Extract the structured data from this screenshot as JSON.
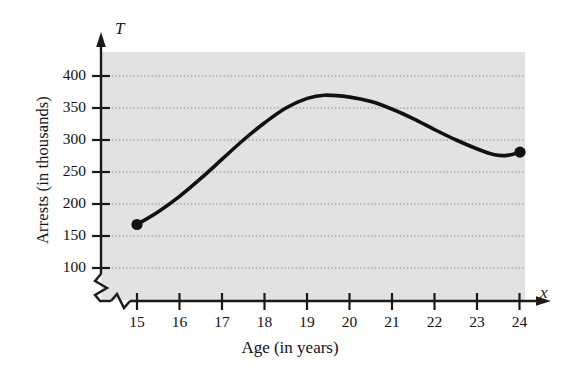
{
  "figure": {
    "background_color": "#ffffff",
    "plot_area_color": "#e2e2e2",
    "curve_color": "#111111",
    "gridline_color": "#8a8a8a",
    "axis_color": "#1a1a1a"
  },
  "axes": {
    "y_axis_name": "T",
    "x_axis_name": "x",
    "y_axis_label": "Arrests (in thousands)",
    "x_axis_label": "Age (in years)",
    "y_ticks": [
      "100",
      "150",
      "200",
      "250",
      "300",
      "350",
      "400"
    ],
    "x_ticks": [
      "15",
      "16",
      "17",
      "18",
      "19",
      "20",
      "21",
      "22",
      "23",
      "24"
    ],
    "y_axis_break": "zigzag",
    "x_axis_break": "zigzag"
  },
  "chart_data": {
    "type": "line",
    "title": "",
    "subtitle": "",
    "xlabel": "Age (in years)",
    "ylabel": "Arrests (in thousands)",
    "xlim": [
      15,
      24
    ],
    "ylim": [
      100,
      420
    ],
    "xtick_values": [
      15,
      16,
      17,
      18,
      19,
      20,
      21,
      22,
      23,
      24
    ],
    "ytick_values": [
      100,
      150,
      200,
      250,
      300,
      350,
      400
    ],
    "grid": true,
    "grid_axis": "y",
    "grid_style": "dotted",
    "legend": false,
    "legend_position": "none",
    "axis_break_below_y": 100,
    "axis_break_before_x": 15,
    "series": [
      {
        "name": "Arrests by age",
        "marker_endpoints": true,
        "x": [
          15,
          15.5,
          16,
          16.5,
          17,
          17.5,
          18,
          18.5,
          19,
          19.4,
          20,
          20.5,
          21,
          21.5,
          22,
          22.5,
          23,
          23.4,
          23.7,
          24
        ],
        "values": [
          168,
          188,
          212,
          240,
          270,
          300,
          327,
          350,
          365,
          370,
          367,
          360,
          348,
          333,
          316,
          300,
          286,
          277,
          276,
          281
        ]
      }
    ],
    "annotations": [
      {
        "label": "left endpoint",
        "x": 15,
        "y": 168,
        "marker": "filled-circle"
      },
      {
        "label": "peak",
        "x": 19.4,
        "y": 370,
        "marker": "none"
      },
      {
        "label": "local minimum",
        "x": 23.4,
        "y": 277,
        "marker": "none"
      },
      {
        "label": "right endpoint",
        "x": 24,
        "y": 281,
        "marker": "filled-circle"
      }
    ]
  }
}
